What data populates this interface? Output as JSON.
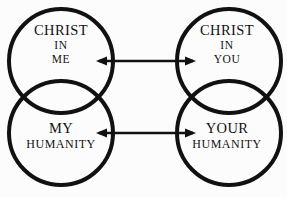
{
  "figure": {
    "type": "venn-diagram",
    "background_color": "#fcfcfc",
    "stroke_color": "#111111",
    "stroke_width": 4
  },
  "circles": [
    {
      "name": "christ-in-me",
      "cx": 61,
      "cy": 61,
      "r": 52
    },
    {
      "name": "christ-in-you",
      "cx": 229,
      "cy": 61,
      "r": 52
    },
    {
      "name": "my-humanity",
      "cx": 61,
      "cy": 133,
      "r": 52
    },
    {
      "name": "your-humanity",
      "cx": 229,
      "cy": 133,
      "r": 52
    }
  ],
  "labels": {
    "christ_in_me": {
      "line1": "CHRIST",
      "line2": "IN",
      "line3": "ME"
    },
    "christ_in_you": {
      "line1": "CHRIST",
      "line2": "IN",
      "line3": "YOU"
    },
    "my_humanity": {
      "line1": "MY",
      "line2": "HUMANITY"
    },
    "your_humanity": {
      "line1": "YOUR",
      "line2": "HUMANITY"
    }
  },
  "arrows": [
    {
      "name": "top-double-arrow",
      "x1": 97,
      "x2": 195,
      "y": 61,
      "heads": "both"
    },
    {
      "name": "bottom-double-arrow",
      "x1": 97,
      "x2": 195,
      "y": 133,
      "heads": "both"
    }
  ]
}
